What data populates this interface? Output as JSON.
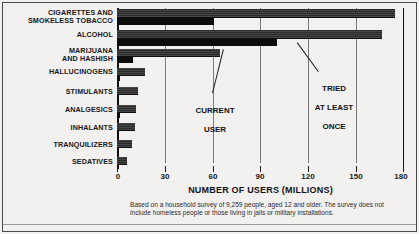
{
  "chart_data": {
    "type": "bar",
    "orientation": "horizontal",
    "title": "",
    "xlabel": "NUMBER OF USERS (MILLIONS)",
    "ylabel": "",
    "xlim": [
      0,
      180
    ],
    "xticks": [
      0,
      30,
      60,
      90,
      120,
      150,
      180
    ],
    "xtick_labels": [
      "0",
      "30",
      "60",
      "90",
      "120",
      "150",
      "180"
    ],
    "grid": true,
    "legend_position": "inline-annotations",
    "categories": [
      "CIGARETTES AND\nSMOKELESS TOBACCO",
      "ALCOHOL",
      "MARIJUANA\nAND HASHISH",
      "HALLUCINOGENS",
      "STIMULANTS",
      "ANALGESICS",
      "INHALANTS",
      "TRANQUILIZERS",
      "SEDATIVES"
    ],
    "series": [
      {
        "name": "TRIED AT LEAST ONCE",
        "values": [
          175,
          167,
          65,
          17.5,
          13.5,
          12,
          11.5,
          9.5,
          6
        ]
      },
      {
        "name": "CURRENT USER",
        "values": [
          61,
          101,
          10,
          2,
          1.5,
          2,
          1.5,
          1,
          0.8
        ]
      }
    ],
    "annotations": [
      {
        "id": "current-user",
        "text": "CURRENT\nUSER"
      },
      {
        "id": "tried-at-least-once",
        "text": "TRIED\nAT LEAST\nONCE"
      }
    ],
    "footnote": "Based on a household survey of 9,259 people, aged 12 and older. The survey does not include homeless people or those living in jails or military installations."
  },
  "axis": {
    "x_title": "NUMBER OF USERS (MILLIONS)",
    "ticks": [
      "0",
      "30",
      "60",
      "90",
      "120",
      "150",
      "180"
    ]
  },
  "categories": {
    "c0_line1": "CIGARETTES AND",
    "c0_line2": "SMOKELESS TOBACCO",
    "c1": "ALCOHOL",
    "c2_line1": "MARIJUANA",
    "c2_line2": "AND HASHISH",
    "c3": "HALLUCINOGENS",
    "c4": "STIMULANTS",
    "c5": "ANALGESICS",
    "c6": "INHALANTS",
    "c7": "TRANQUILIZERS",
    "c8": "SEDATIVES"
  },
  "annotations": {
    "current_user_line1": "CURRENT",
    "current_user_line2": "USER",
    "tried_line1": "TRIED",
    "tried_line2": "AT LEAST",
    "tried_line3": "ONCE"
  },
  "footnote": {
    "text": "Based on a household survey of 9,259 people, aged 12 and older. The survey does not include homeless people or those living in jails or military installations."
  },
  "colors": {
    "bar_tried": "#2b2b2b",
    "bar_current": "#0c0c0c",
    "background": "#f2f1ef",
    "gridline": "#7b7a78",
    "text": "#17171a"
  }
}
